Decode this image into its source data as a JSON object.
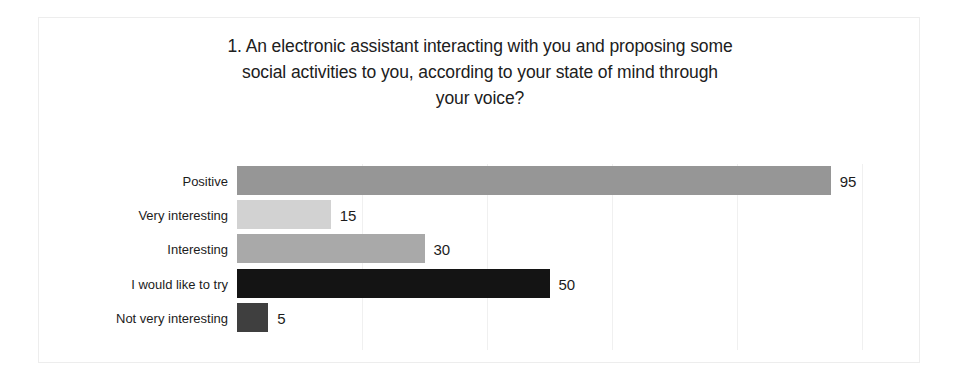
{
  "chart_data": {
    "type": "bar",
    "orientation": "horizontal",
    "title": "1. An electronic assistant interacting with you and proposing some social activities to you, according to your state of mind through your voice?",
    "title_lines": [
      "1. An electronic assistant interacting with you and proposing some",
      "social activities to you, according to your state of mind through",
      "your voice?"
    ],
    "categories": [
      "Positive",
      "Very interesting",
      "Interesting",
      "I would like to try",
      "Not very interesting"
    ],
    "values": [
      95,
      15,
      30,
      50,
      5
    ],
    "value_labels": [
      "95",
      "15",
      "30",
      "50",
      "5"
    ],
    "bar_colors": [
      "#969696",
      "#d2d2d2",
      "#a9a9a9",
      "#141414",
      "#3f3f3f"
    ],
    "xlabel": "",
    "ylabel": "",
    "xlim": [
      0,
      100
    ],
    "ylim": null,
    "grid": true,
    "grid_axis": "x",
    "grid_color": "#f0f0f0",
    "gridline_values": [
      20,
      40,
      60,
      80,
      100
    ],
    "legend": false,
    "legend_position": "none",
    "axis_lines": false,
    "tick_labels_x": [],
    "tick_labels_y": [
      "Positive",
      "Very interesting",
      "Interesting",
      "I would like to try",
      "Not very interesting"
    ],
    "data_labels_shown": true,
    "background_color": "#ffffff",
    "text_color": "#1c1c1c"
  }
}
